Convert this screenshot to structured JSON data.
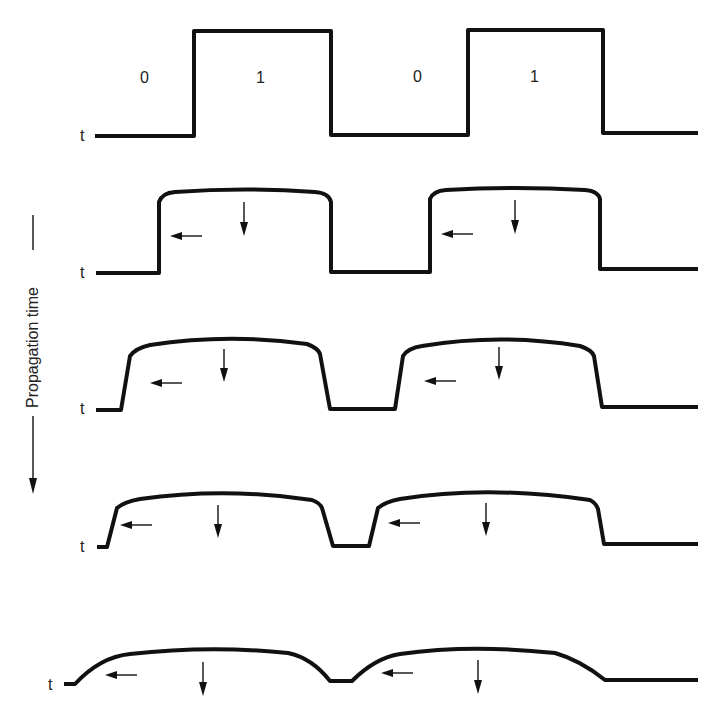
{
  "diagram": {
    "type": "waveform-propagation",
    "side_label": "Propagation time",
    "time_axis_label": "t",
    "bit_labels": [
      "0",
      "1",
      "0",
      "1"
    ],
    "stages": [
      {
        "name": "stage-1-ideal",
        "description": "Ideal square pulses"
      },
      {
        "name": "stage-2",
        "description": "Slight droop, vertical edges"
      },
      {
        "name": "stage-3",
        "description": "Sloped edges, more droop"
      },
      {
        "name": "stage-4",
        "description": "Greater slope, narrow low gap"
      },
      {
        "name": "stage-5",
        "description": "Rounded, nearly merged pulses"
      }
    ],
    "annotations": {
      "left_arrow": "edge spreading / dispersion",
      "down_arrow": "amplitude attenuation"
    },
    "colors": {
      "stroke": "#111111",
      "background": "#ffffff"
    }
  }
}
